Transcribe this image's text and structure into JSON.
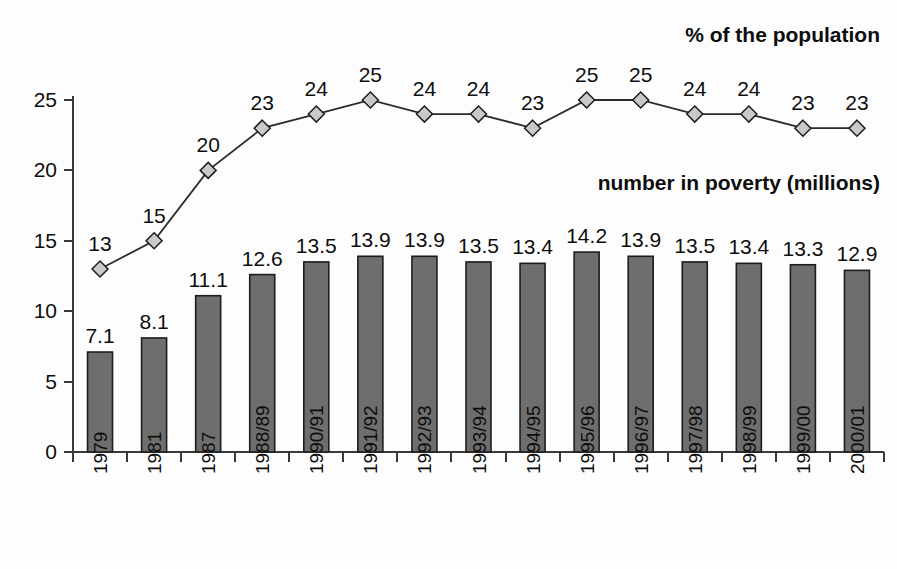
{
  "chart_data": {
    "type": "bar",
    "title": "",
    "subtitle": "",
    "xlabel": "",
    "ylabel": "",
    "ylim": [
      0,
      27
    ],
    "yticks": [
      "0",
      "5",
      "10",
      "15",
      "20",
      "25"
    ],
    "ytick_values": [
      0,
      5,
      10,
      15,
      20,
      25
    ],
    "grid": false,
    "legend_position": "inline-annotations",
    "categories": [
      "1979",
      "1981",
      "1987",
      "1988/89",
      "1990/91",
      "1991/92",
      "1992/93",
      "1993/94",
      "1994/95",
      "1995/96",
      "1996/97",
      "1997/98",
      "1998/99",
      "1999/00",
      "2000/01"
    ],
    "series": [
      {
        "name": "number in poverty (millions)",
        "type": "bar",
        "values": [
          7.1,
          8.1,
          11.1,
          12.6,
          13.5,
          13.9,
          13.9,
          13.5,
          13.4,
          14.2,
          13.9,
          13.5,
          13.4,
          13.3,
          12.9
        ],
        "labels": [
          "7.1",
          "8.1",
          "11.1",
          "12.6",
          "13.5",
          "13.9",
          "13.9",
          "13.5",
          "13.4",
          "14.2",
          "13.9",
          "13.5",
          "13.4",
          "13.3",
          "12.9"
        ],
        "color": "#6e6e6e",
        "edge_color": "#1d1d1d"
      },
      {
        "name": "% of the population",
        "type": "line",
        "values": [
          13,
          15,
          20,
          23,
          24,
          25,
          24,
          24,
          23,
          25,
          25,
          24,
          24,
          23,
          23
        ],
        "labels": [
          "13",
          "15",
          "20",
          "23",
          "24",
          "25",
          "24",
          "24",
          "23",
          "25",
          "25",
          "24",
          "24",
          "23",
          "23"
        ],
        "color": "#2b2b2b",
        "marker": "diamond",
        "marker_face_color": "#c9c9c9"
      }
    ],
    "annotations": [
      {
        "text": "% of the population",
        "x": 880,
        "y": 42
      },
      {
        "text": "number in poverty (millions)",
        "x": 880,
        "y": 190
      }
    ]
  },
  "captions": {
    "percent_series": "% of the population",
    "millions_series": "number in poverty (millions)"
  },
  "colors": {
    "bar_fill": "#6e6e6e",
    "bar_edge": "#1d1d1d",
    "line_stroke": "#2b2b2b",
    "marker_fill": "#c9c9c9",
    "axis": "#3a3a3a",
    "text": "#0d0d0d",
    "background": "#fdfdfd"
  }
}
